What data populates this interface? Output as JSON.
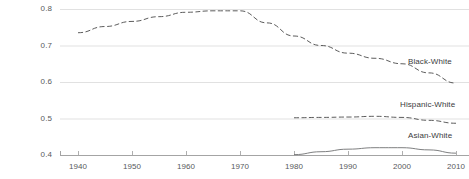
{
  "chart_data": {
    "type": "line",
    "title": "",
    "subtitle": "",
    "xlabel": "",
    "ylabel": "",
    "xlim": [
      1935,
      2012
    ],
    "ylim": [
      0.4,
      0.8
    ],
    "grid": true,
    "legend_position": "inline-right",
    "x_ticks": [
      1940,
      1950,
      1960,
      1970,
      1980,
      1990,
      2000,
      2010
    ],
    "x_tick_labels": [
      "1940",
      "1950",
      "1960",
      "1970",
      "1980",
      "1990",
      "2000",
      "2010"
    ],
    "y_ticks": [
      0.4,
      0.5,
      0.6,
      0.7,
      0.8
    ],
    "y_tick_labels": [
      "0.4",
      "0.5",
      "0.6",
      "0.7",
      "0.8"
    ],
    "series": [
      {
        "name": "Black-White",
        "label": "Black-White",
        "style": "dashed",
        "color": "#4a4a4a",
        "x": [
          1940,
          1945,
          1950,
          1955,
          1960,
          1965,
          1970,
          1975,
          1980,
          1985,
          1990,
          1995,
          2000,
          2005,
          2010
        ],
        "values": [
          0.735,
          0.752,
          0.766,
          0.779,
          0.791,
          0.795,
          0.795,
          0.762,
          0.726,
          0.7,
          0.679,
          0.665,
          0.65,
          0.625,
          0.597
        ]
      },
      {
        "name": "Hispanic-White",
        "label": "Hispanic-White",
        "style": "dashed",
        "color": "#4a4a4a",
        "x": [
          1980,
          1985,
          1990,
          1995,
          2000,
          2005,
          2010
        ],
        "values": [
          0.502,
          0.503,
          0.504,
          0.506,
          0.503,
          0.495,
          0.487
        ]
      },
      {
        "name": "Asian-White",
        "label": "Asian-White",
        "style": "solid",
        "color": "#6f7072",
        "x": [
          1980,
          1985,
          1990,
          1995,
          2000,
          2005,
          2010
        ],
        "values": [
          0.401,
          0.409,
          0.416,
          0.42,
          0.42,
          0.414,
          0.405
        ]
      }
    ]
  },
  "axis_colors": {
    "gridline": "#d9d9d9",
    "axis": "#9a9a9a",
    "tick_text": "#58595b",
    "series_label": "#3b3b3d"
  }
}
